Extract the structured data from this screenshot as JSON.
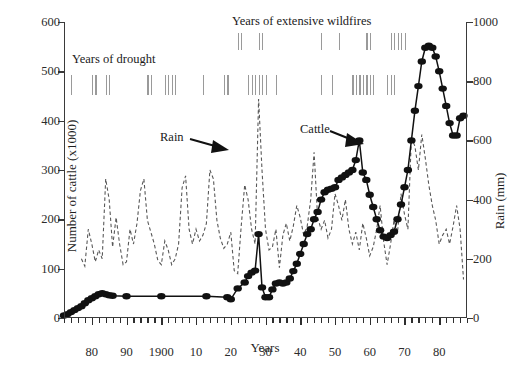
{
  "chart_data": {
    "type": "line",
    "title": "",
    "xlabel": "Years",
    "ylabel_left": "Number of cattle (x1000)",
    "ylabel_right": "Rain (mm)",
    "grid": false,
    "legend_position": "inline-annotations",
    "xlim": [
      1872,
      1886
    ],
    "x_axis_note": "years 1872 to 1886 spanning 1870s through 1980s",
    "x_ticks": [
      {
        "label": "80",
        "year": 1880
      },
      {
        "label": "90",
        "year": 1890
      },
      {
        "label": "1900",
        "year": 1900
      },
      {
        "label": "10",
        "year": 1910
      },
      {
        "label": "20",
        "year": 1920
      },
      {
        "label": "30",
        "year": 1930
      },
      {
        "label": "40",
        "year": 1940
      },
      {
        "label": "50",
        "year": 1950
      },
      {
        "label": "60",
        "year": 1960
      },
      {
        "label": "70",
        "year": 1970
      },
      {
        "label": "80",
        "year": 1980
      }
    ],
    "y_ticks_left": [
      "0",
      "100",
      "200",
      "300",
      "400",
      "500",
      "600"
    ],
    "ylim_left": [
      0,
      600
    ],
    "y_ticks_right": [
      "0",
      "200",
      "400",
      "600",
      "800",
      "1000"
    ],
    "ylim_right": [
      0,
      1000
    ],
    "annotations": [
      {
        "text": "Years of drought",
        "name": "drought-label"
      },
      {
        "text": "Years of extensive wildfires",
        "name": "wildfire-label"
      },
      {
        "text": "Rain",
        "name": "rain-label"
      },
      {
        "text": "Cattle",
        "name": "cattle-label"
      }
    ],
    "series": [
      {
        "name": "Cattle",
        "style": "solid-line-with-filled-circle-markers",
        "axis": "left",
        "unit": "x1000 head",
        "points": [
          [
            1872,
            5
          ],
          [
            1873,
            8
          ],
          [
            1874,
            12
          ],
          [
            1875,
            16
          ],
          [
            1876,
            20
          ],
          [
            1877,
            24
          ],
          [
            1878,
            30
          ],
          [
            1879,
            36
          ],
          [
            1880,
            40
          ],
          [
            1881,
            44
          ],
          [
            1882,
            48
          ],
          [
            1883,
            50
          ],
          [
            1884,
            48
          ],
          [
            1885,
            46
          ],
          [
            1886,
            45
          ],
          [
            1890,
            44
          ],
          [
            1900,
            44
          ],
          [
            1913,
            44
          ],
          [
            1919,
            42
          ],
          [
            1920,
            38
          ],
          [
            1922,
            60
          ],
          [
            1924,
            72
          ],
          [
            1925,
            85
          ],
          [
            1926,
            92
          ],
          [
            1927,
            96
          ],
          [
            1928,
            170
          ],
          [
            1929,
            62
          ],
          [
            1930,
            42
          ],
          [
            1931,
            42
          ],
          [
            1932,
            58
          ],
          [
            1933,
            70
          ],
          [
            1934,
            72
          ],
          [
            1935,
            70
          ],
          [
            1936,
            72
          ],
          [
            1937,
            80
          ],
          [
            1938,
            95
          ],
          [
            1939,
            110
          ],
          [
            1940,
            130
          ],
          [
            1941,
            150
          ],
          [
            1942,
            170
          ],
          [
            1943,
            180
          ],
          [
            1944,
            200
          ],
          [
            1945,
            215
          ],
          [
            1946,
            240
          ],
          [
            1947,
            255
          ],
          [
            1948,
            260
          ],
          [
            1949,
            262
          ],
          [
            1950,
            265
          ],
          [
            1951,
            280
          ],
          [
            1952,
            285
          ],
          [
            1953,
            290
          ],
          [
            1954,
            295
          ],
          [
            1955,
            300
          ],
          [
            1956,
            320
          ],
          [
            1957,
            360
          ],
          [
            1958,
            295
          ],
          [
            1959,
            280
          ],
          [
            1960,
            250
          ],
          [
            1961,
            225
          ],
          [
            1962,
            200
          ],
          [
            1963,
            178
          ],
          [
            1964,
            165
          ],
          [
            1965,
            162
          ],
          [
            1966,
            168
          ],
          [
            1967,
            175
          ],
          [
            1968,
            200
          ],
          [
            1969,
            230
          ],
          [
            1970,
            265
          ],
          [
            1971,
            300
          ],
          [
            1972,
            360
          ],
          [
            1973,
            420
          ],
          [
            1974,
            470
          ],
          [
            1975,
            520
          ],
          [
            1976,
            548
          ],
          [
            1977,
            552
          ],
          [
            1978,
            548
          ],
          [
            1979,
            530
          ],
          [
            1980,
            500
          ],
          [
            1981,
            465
          ],
          [
            1982,
            430
          ],
          [
            1983,
            395
          ],
          [
            1984,
            370
          ],
          [
            1985,
            370
          ],
          [
            1986,
            405
          ],
          [
            1987,
            410
          ]
        ]
      },
      {
        "name": "Rain",
        "style": "dashed-line",
        "axis": "right",
        "unit": "mm",
        "points": [
          [
            1877,
            200
          ],
          [
            1878,
            175
          ],
          [
            1879,
            300
          ],
          [
            1880,
            250
          ],
          [
            1881,
            190
          ],
          [
            1882,
            230
          ],
          [
            1883,
            200
          ],
          [
            1884,
            470
          ],
          [
            1885,
            400
          ],
          [
            1886,
            240
          ],
          [
            1887,
            340
          ],
          [
            1888,
            250
          ],
          [
            1889,
            180
          ],
          [
            1890,
            190
          ],
          [
            1891,
            300
          ],
          [
            1892,
            250
          ],
          [
            1893,
            320
          ],
          [
            1894,
            430
          ],
          [
            1895,
            470
          ],
          [
            1896,
            330
          ],
          [
            1897,
            290
          ],
          [
            1898,
            250
          ],
          [
            1899,
            195
          ],
          [
            1900,
            180
          ],
          [
            1901,
            260
          ],
          [
            1902,
            230
          ],
          [
            1903,
            180
          ],
          [
            1904,
            200
          ],
          [
            1905,
            250
          ],
          [
            1906,
            440
          ],
          [
            1907,
            480
          ],
          [
            1908,
            300
          ],
          [
            1909,
            250
          ],
          [
            1910,
            300
          ],
          [
            1911,
            260
          ],
          [
            1912,
            280
          ],
          [
            1913,
            320
          ],
          [
            1914,
            500
          ],
          [
            1915,
            470
          ],
          [
            1916,
            330
          ],
          [
            1917,
            270
          ],
          [
            1918,
            235
          ],
          [
            1919,
            250
          ],
          [
            1920,
            290
          ],
          [
            1921,
            160
          ],
          [
            1922,
            150
          ],
          [
            1923,
            310
          ],
          [
            1924,
            450
          ],
          [
            1925,
            400
          ],
          [
            1926,
            300
          ],
          [
            1927,
            250
          ],
          [
            1928,
            740
          ],
          [
            1929,
            500
          ],
          [
            1930,
            300
          ],
          [
            1931,
            230
          ],
          [
            1932,
            240
          ],
          [
            1933,
            300
          ],
          [
            1934,
            170
          ],
          [
            1935,
            280
          ],
          [
            1936,
            320
          ],
          [
            1937,
            260
          ],
          [
            1938,
            310
          ],
          [
            1939,
            380
          ],
          [
            1940,
            340
          ],
          [
            1941,
            280
          ],
          [
            1942,
            310
          ],
          [
            1943,
            400
          ],
          [
            1944,
            560
          ],
          [
            1945,
            340
          ],
          [
            1946,
            300
          ],
          [
            1947,
            330
          ],
          [
            1948,
            270
          ],
          [
            1949,
            300
          ],
          [
            1950,
            420
          ],
          [
            1951,
            380
          ],
          [
            1952,
            330
          ],
          [
            1953,
            400
          ],
          [
            1954,
            300
          ],
          [
            1955,
            250
          ],
          [
            1956,
            290
          ],
          [
            1957,
            230
          ],
          [
            1958,
            320
          ],
          [
            1959,
            270
          ],
          [
            1960,
            210
          ],
          [
            1961,
            240
          ],
          [
            1962,
            300
          ],
          [
            1963,
            380
          ],
          [
            1964,
            260
          ],
          [
            1965,
            180
          ],
          [
            1966,
            250
          ],
          [
            1967,
            330
          ],
          [
            1968,
            290
          ],
          [
            1969,
            420
          ],
          [
            1970,
            350
          ],
          [
            1971,
            300
          ],
          [
            1972,
            610
          ],
          [
            1973,
            580
          ],
          [
            1974,
            500
          ],
          [
            1975,
            620
          ],
          [
            1976,
            540
          ],
          [
            1977,
            450
          ],
          [
            1978,
            380
          ],
          [
            1979,
            330
          ],
          [
            1980,
            250
          ],
          [
            1981,
            280
          ],
          [
            1982,
            300
          ],
          [
            1983,
            250
          ],
          [
            1984,
            310
          ],
          [
            1985,
            380
          ],
          [
            1986,
            300
          ],
          [
            1987,
            130
          ]
        ]
      }
    ],
    "event_marks": {
      "drought_years": [
        1874,
        1880,
        1881,
        1884,
        1885,
        1896,
        1897,
        1901,
        1902,
        1903,
        1904,
        1912,
        1918,
        1919,
        1925,
        1926,
        1927,
        1928,
        1929,
        1930,
        1933,
        1946,
        1949,
        1955,
        1956,
        1957,
        1958,
        1959,
        1960,
        1961,
        1965,
        1966,
        1967
      ],
      "wildfire_years": [
        1922,
        1923,
        1928,
        1929,
        1946,
        1951,
        1959,
        1960,
        1966,
        1967,
        1968,
        1969,
        1970
      ]
    }
  }
}
